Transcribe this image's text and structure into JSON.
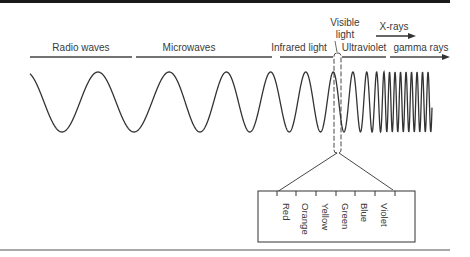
{
  "diagram": {
    "bands": [
      {
        "label": "Radio waves"
      },
      {
        "label": "Microwaves"
      },
      {
        "label": "Infrared light"
      },
      {
        "label": "Ultraviolet"
      },
      {
        "label": "gamma rays"
      }
    ],
    "visible_label_line1": "Visible",
    "visible_label_line2": "light",
    "xrays_label": "X-rays",
    "visible_colors": [
      "Red",
      "Orange",
      "Yellow",
      "Green",
      "Blue",
      "Violet"
    ],
    "colors": {
      "ink": "#333333",
      "frame": "#222222"
    }
  }
}
